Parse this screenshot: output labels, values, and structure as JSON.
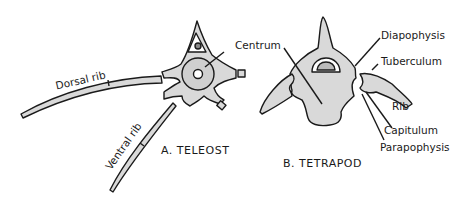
{
  "diagram": {
    "panels": [
      {
        "caption": "A. TELEOST",
        "labels": {
          "dorsal_rib": "Dorsal rib",
          "ventral_rib": "Ventral rib"
        }
      },
      {
        "caption": "B. TETRAPOD",
        "labels": {
          "centrum": "Centrum",
          "diapophysis": "Diapophysis",
          "tuberculum": "Tuberculum",
          "rib": "Rib",
          "capitulum": "Capitulum",
          "parapophysis": "Parapophysis"
        }
      }
    ],
    "colors": {
      "bone_fill": "#d9d9d9",
      "stroke": "#1a1a1a",
      "background": "#ffffff"
    }
  }
}
